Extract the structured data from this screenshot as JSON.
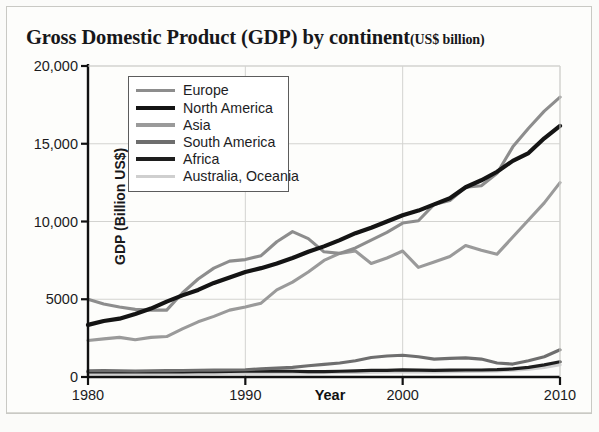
{
  "chart_title": {
    "main": "Gross Domestic Product (GDP) by continent",
    "unit": "(US$ billion)"
  },
  "axis": {
    "y_title": "GDP (Billion US$)",
    "x_title": "Year",
    "y_ticks": [
      "0",
      "5000",
      "10,000",
      "15,000",
      "20,000"
    ],
    "x_ticks": [
      "1980",
      "1990",
      "2000",
      "2010"
    ]
  },
  "legend": {
    "items": [
      {
        "label": "Europe",
        "color": "#8d8d8d"
      },
      {
        "label": "North America",
        "color": "#141414"
      },
      {
        "label": "Asia",
        "color": "#9a9a9a"
      },
      {
        "label": "South America",
        "color": "#6e6e6e"
      },
      {
        "label": "Africa",
        "color": "#1e1e1e"
      },
      {
        "label": "Australia, Oceania",
        "color": "#cfcfcf"
      }
    ]
  },
  "chart_data": {
    "type": "line",
    "xlabel": "Year",
    "ylabel": "GDP (Billion US$)",
    "xlim": [
      1980,
      2010
    ],
    "ylim": [
      0,
      20000
    ],
    "y_ticks": [
      0,
      5000,
      10000,
      15000,
      20000
    ],
    "x_ticks": [
      1980,
      1990,
      2000,
      2010
    ],
    "grid": true,
    "legend_position": "upper-left-inside",
    "x": [
      1980,
      1981,
      1982,
      1983,
      1984,
      1985,
      1986,
      1987,
      1988,
      1989,
      1990,
      1991,
      1992,
      1993,
      1994,
      1995,
      1996,
      1997,
      1998,
      1999,
      2000,
      2001,
      2002,
      2003,
      2004,
      2005,
      2006,
      2007,
      2008,
      2009,
      2010
    ],
    "series": [
      {
        "name": "Europe",
        "color": "#8d8d8d",
        "values": [
          5000,
          4700,
          4500,
          4350,
          4300,
          4300,
          5400,
          6300,
          7000,
          7450,
          7550,
          7800,
          8700,
          9350,
          8900,
          8050,
          7950,
          8300,
          8800,
          9300,
          9900,
          10050,
          11100,
          11350,
          12200,
          12300,
          13100,
          14800,
          16000,
          17100,
          18000
        ]
      },
      {
        "name": "North America",
        "color": "#141414",
        "values": [
          3350,
          3600,
          3750,
          4050,
          4400,
          4850,
          5250,
          5600,
          6050,
          6400,
          6750,
          7000,
          7300,
          7650,
          8050,
          8400,
          8800,
          9250,
          9600,
          10000,
          10400,
          10700,
          11100,
          11500,
          12200,
          12650,
          13200,
          13900,
          14400,
          15350,
          16150
        ]
      },
      {
        "name": "Asia",
        "color": "#9a9a9a",
        "values": [
          2350,
          2450,
          2550,
          2400,
          2550,
          2600,
          3100,
          3550,
          3900,
          4300,
          4500,
          4750,
          5600,
          6100,
          6750,
          7500,
          7950,
          8100,
          7300,
          7650,
          8100,
          7050,
          7400,
          7750,
          8450,
          8150,
          7900,
          9000,
          10100,
          11200,
          12500
        ]
      },
      {
        "name": "South America",
        "color": "#6e6e6e",
        "values": [
          400,
          410,
          400,
          390,
          400,
          410,
          420,
          430,
          440,
          450,
          470,
          520,
          570,
          620,
          720,
          810,
          900,
          1050,
          1250,
          1350,
          1400,
          1300,
          1150,
          1200,
          1230,
          1150,
          900,
          830,
          1050,
          1300,
          1750
        ]
      },
      {
        "name": "Africa",
        "color": "#1e1e1e",
        "values": [
          330,
          330,
          325,
          320,
          320,
          325,
          330,
          340,
          350,
          360,
          370,
          380,
          380,
          370,
          350,
          350,
          370,
          400,
          420,
          430,
          460,
          440,
          430,
          440,
          450,
          450,
          470,
          520,
          620,
          780,
          980
        ]
      },
      {
        "name": "Australia, Oceania",
        "color": "#cfcfcf",
        "values": [
          210,
          205,
          200,
          200,
          205,
          210,
          215,
          220,
          230,
          240,
          250,
          255,
          260,
          265,
          270,
          280,
          290,
          300,
          310,
          320,
          330,
          330,
          335,
          345,
          360,
          380,
          400,
          440,
          500,
          620,
          790
        ]
      }
    ]
  },
  "geometry": {
    "plot_left": 88,
    "plot_right": 560,
    "plot_top": 66,
    "plot_bottom": 377
  }
}
